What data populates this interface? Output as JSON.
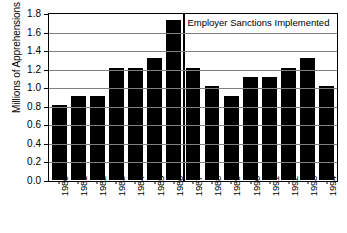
{
  "chart_data": {
    "type": "bar",
    "title": "",
    "subtitle": "",
    "xlabel": "",
    "ylabel": "Millions of Apprehensions",
    "ylim": [
      0.0,
      1.8
    ],
    "ytick_labels": [
      "1.8",
      "1.6",
      "1.4",
      "1.2",
      "1.0",
      "0.8",
      "0.6",
      "0.4",
      "0.2",
      "0.0"
    ],
    "ytick_values": [
      1.8,
      1.6,
      1.4,
      1.2,
      1.0,
      0.8,
      0.6,
      0.4,
      0.2,
      0.0
    ],
    "grid": true,
    "grid_axis": "y",
    "legend": null,
    "legend_position": "none",
    "bar_color": "#000000",
    "plot_background": "#ffffff",
    "grid_color": "#808080",
    "axis_color": "#000000",
    "categories": [
      "1980",
      "1981",
      "1982",
      "1983",
      "1984",
      "1985",
      "1986",
      "1987",
      "1988",
      "1989",
      "1990",
      "1991",
      "1992",
      "1993",
      "1994"
    ],
    "values": [
      0.81,
      0.91,
      0.91,
      1.21,
      1.21,
      1.31,
      1.72,
      1.21,
      1.01,
      0.91,
      1.11,
      1.11,
      1.21,
      1.31,
      1.01
    ],
    "annotations": [
      {
        "text": "Employer Sanctions Implemented",
        "type": "vline-label",
        "vline_between": [
          "1986",
          "1987"
        ],
        "vline_value": 1986.5
      }
    ]
  }
}
